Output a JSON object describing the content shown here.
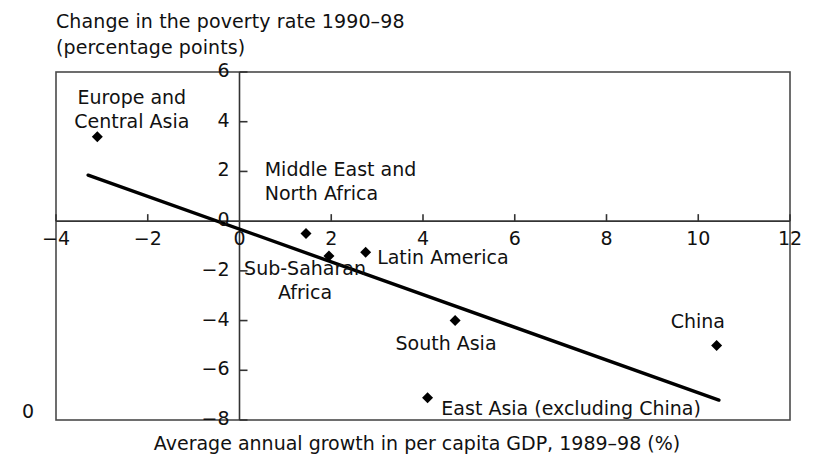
{
  "chart_data": {
    "type": "scatter",
    "title_line1": "Change in the poverty rate 1990–98",
    "title_line2": "(percentage points)",
    "xlabel": "Average annual growth in per capita GDP, 1989–98 (%)",
    "ylabel": "Change in the poverty rate 1990–98 (percentage points)",
    "xlim": [
      -4,
      12
    ],
    "ylim": [
      -8,
      6
    ],
    "xticks": [
      "−4",
      "−2",
      "0",
      "2",
      "4",
      "6",
      "8",
      "10",
      "12"
    ],
    "xtick_values": [
      -4,
      -2,
      0,
      2,
      4,
      6,
      8,
      10,
      12
    ],
    "yticks": [
      "6",
      "4",
      "2",
      "0",
      "−2",
      "−4",
      "−6",
      "−8"
    ],
    "ytick_values": [
      6,
      4,
      2,
      0,
      -2,
      -4,
      -6,
      -8
    ],
    "grid": false,
    "legend": false,
    "corner_label": "0",
    "points": [
      {
        "label": "Europe and\nCentral Asia",
        "label_line1": "Europe and",
        "label_line2": "Central Asia",
        "x": -3.1,
        "y": 3.4,
        "label_x": -3.6,
        "label_y": 5.0,
        "label_align": "left"
      },
      {
        "label": "Middle East and\nNorth Africa",
        "label_line1": "Middle East and",
        "label_line2": "North Africa",
        "x": 1.45,
        "y": -0.5,
        "label_x": 0.55,
        "label_y": 2.1,
        "label_align": "left"
      },
      {
        "label": "Sub-Saharan\nAfrica",
        "label_line1": "Sub-Saharan",
        "label_line2": "Africa",
        "x": 1.95,
        "y": -1.4,
        "label_x": 0.1,
        "label_y": -1.9,
        "label_align": "left"
      },
      {
        "label": "Latin America",
        "label_line1": "Latin America",
        "label_line2": "",
        "x": 2.75,
        "y": -1.25,
        "label_x": 3.0,
        "label_y": -1.45,
        "label_align": "left"
      },
      {
        "label": "South Asia",
        "label_line1": "South Asia",
        "label_line2": "",
        "x": 4.7,
        "y": -4.0,
        "label_x": 3.4,
        "label_y": -4.9,
        "label_align": "left"
      },
      {
        "label": "China",
        "label_line1": "China",
        "label_line2": "",
        "x": 10.4,
        "y": -5.0,
        "label_x": 9.4,
        "label_y": -4.0,
        "label_align": "left"
      },
      {
        "label": "East Asia (excluding China)",
        "label_line1": "East Asia (excluding China)",
        "label_line2": "",
        "x": 4.1,
        "y": -7.1,
        "label_x": 4.4,
        "label_y": -7.5,
        "label_align": "left"
      }
    ],
    "trendline": {
      "x0": -3.3,
      "y0": 1.85,
      "x1": 10.45,
      "y1": -7.2,
      "style": "solid",
      "color": "#000000"
    },
    "marker": {
      "shape": "diamond",
      "color": "#000000",
      "size": 11
    },
    "frame_color": "#4a4a4a"
  }
}
